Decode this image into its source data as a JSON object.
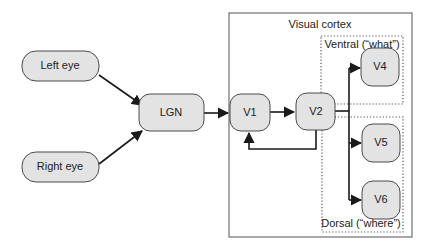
{
  "diagram": {
    "type": "flowchart",
    "groups": {
      "visual_cortex": {
        "label": "Visual cortex"
      },
      "ventral": {
        "label": "Ventral (“what”)"
      },
      "dorsal": {
        "label": "Dorsal (“where”)"
      }
    },
    "nodes": {
      "left_eye": {
        "label": "Left eye"
      },
      "right_eye": {
        "label": "Right eye"
      },
      "lgn": {
        "label": "LGN"
      },
      "v1": {
        "label": "V1"
      },
      "v2": {
        "label": "V2"
      },
      "v4": {
        "label": "V4"
      },
      "v5": {
        "label": "V5"
      },
      "v6": {
        "label": "V6"
      }
    },
    "edges": [
      {
        "from": "Left eye",
        "to": "LGN"
      },
      {
        "from": "Right eye",
        "to": "LGN"
      },
      {
        "from": "LGN",
        "to": "V1"
      },
      {
        "from": "V1",
        "to": "V2"
      },
      {
        "from": "V2",
        "to": "V1"
      },
      {
        "from": "V2",
        "to": "V4"
      },
      {
        "from": "V2",
        "to": "V5"
      },
      {
        "from": "V2",
        "to": "V6"
      }
    ],
    "colors": {
      "node_fill": "#e3e3e3",
      "node_stroke": "#4a4a4a",
      "edge": "#1a1a1a",
      "frame": "#7a7a7a"
    }
  }
}
